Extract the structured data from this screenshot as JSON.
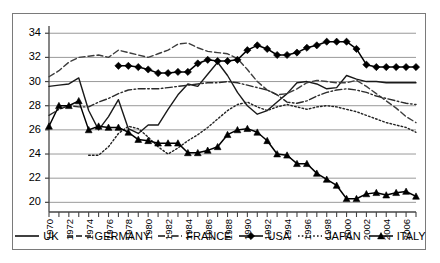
{
  "chart_data": {
    "type": "line",
    "title": "",
    "xlabel": "",
    "ylabel": "",
    "xlim": [
      1970,
      2007
    ],
    "ylim": [
      19.2,
      34.6
    ],
    "yticks": [
      20,
      22,
      24,
      26,
      28,
      30,
      32,
      34
    ],
    "ytick_labels": [
      "20",
      "22",
      "24",
      "26",
      "28",
      "30",
      "32",
      "34"
    ],
    "xticks": [
      1970,
      1971,
      1972,
      1973,
      1974,
      1975,
      1976,
      1977,
      1978,
      1979,
      1980,
      1981,
      1982,
      1983,
      1984,
      1985,
      1986,
      1987,
      1988,
      1989,
      1990,
      1991,
      1992,
      1993,
      1994,
      1995,
      1996,
      1997,
      1998,
      1999,
      2000,
      2001,
      2002,
      2003,
      2004,
      2005,
      2006,
      2007
    ],
    "xtick_labels": [
      "1970",
      "1972",
      "1974",
      "1976",
      "1978",
      "1980",
      "1982",
      "1984",
      "1986",
      "1988",
      "1990",
      "1992",
      "1994",
      "1996",
      "1998",
      "2000",
      "2002",
      "2004",
      "2006"
    ],
    "xtick_labels_years": [
      1970,
      1972,
      1974,
      1976,
      1978,
      1980,
      1982,
      1984,
      1986,
      1988,
      1990,
      1992,
      1994,
      1996,
      1998,
      2000,
      2002,
      2004,
      2006
    ],
    "grid": "horizontal",
    "legend_position": "bottom",
    "x": [
      1970,
      1971,
      1972,
      1973,
      1974,
      1975,
      1976,
      1977,
      1978,
      1979,
      1980,
      1981,
      1982,
      1983,
      1984,
      1985,
      1986,
      1987,
      1988,
      1989,
      1990,
      1991,
      1992,
      1993,
      1994,
      1995,
      1996,
      1997,
      1998,
      1999,
      2000,
      2001,
      2002,
      2003,
      2004,
      2005,
      2006,
      2007
    ],
    "series": [
      {
        "name": "UK",
        "style": "solid",
        "marker": "none",
        "color": "#1a1a1a",
        "x": [
          1970,
          1971,
          1972,
          1973,
          1974,
          1975,
          1976,
          1977,
          1978,
          1979,
          1980,
          1981,
          1982,
          1983,
          1984,
          1985,
          1986,
          1987,
          1988,
          1989,
          1990,
          1991,
          1992,
          1993,
          1994,
          1995,
          1996,
          1997,
          1998,
          1999,
          2000,
          2001,
          2002,
          2003,
          2004,
          2005,
          2006,
          2007
        ],
        "values": [
          29.6,
          29.7,
          29.8,
          30.3,
          27.6,
          26.0,
          27.1,
          28.5,
          26.1,
          25.7,
          26.4,
          26.4,
          27.7,
          28.9,
          29.8,
          29.6,
          30.6,
          31.6,
          30.5,
          29.1,
          28.0,
          27.3,
          27.6,
          28.3,
          29.0,
          29.9,
          30.0,
          29.8,
          29.4,
          29.5,
          30.5,
          30.2,
          30.0,
          30.0,
          29.9,
          29.9,
          29.9,
          29.9
        ]
      },
      {
        "name": "GERMANY",
        "style": "dashed",
        "marker": "none",
        "color": "#3d3d3d",
        "x": [
          1970,
          1971,
          1972,
          1973,
          1974,
          1975,
          1976,
          1977,
          1978,
          1979,
          1980,
          1981,
          1982,
          1983,
          1984,
          1985,
          1986,
          1987,
          1988,
          1989,
          1990,
          1991,
          1992,
          1993,
          1994,
          1995,
          1996,
          1997,
          1998,
          1999,
          2000,
          2001,
          2002,
          2003,
          2004,
          2005,
          2006,
          2007
        ],
        "values": [
          30.4,
          30.9,
          31.6,
          32.0,
          32.1,
          32.2,
          32.0,
          32.6,
          32.4,
          32.2,
          32.0,
          32.3,
          32.6,
          33.1,
          33.2,
          32.8,
          32.5,
          32.4,
          32.3,
          31.9,
          31.0,
          30.0,
          29.3,
          28.9,
          29.0,
          29.4,
          29.9,
          30.1,
          30.0,
          29.9,
          29.9,
          30.1,
          29.6,
          29.0,
          28.4,
          27.8,
          27.1,
          26.6
        ]
      },
      {
        "name": "FRANCE",
        "style": "dashdot",
        "marker": "none",
        "color": "#2b2b2b",
        "x": [
          1970,
          1971,
          1972,
          1973,
          1974,
          1975,
          1976,
          1977,
          1978,
          1979,
          1980,
          1981,
          1982,
          1983,
          1984,
          1985,
          1986,
          1987,
          1988,
          1989,
          1990,
          1991,
          1992,
          1993,
          1994,
          1995,
          1996,
          1997,
          1998,
          1999,
          2000,
          2001,
          2002,
          2003,
          2004,
          2005,
          2006,
          2007
        ],
        "values": [
          27.2,
          27.7,
          28.0,
          27.9,
          27.9,
          28.3,
          28.6,
          29.0,
          29.3,
          29.4,
          29.4,
          29.4,
          29.5,
          29.6,
          29.7,
          29.8,
          29.9,
          29.9,
          30.0,
          29.9,
          29.7,
          29.5,
          29.3,
          28.9,
          28.3,
          28.2,
          28.4,
          28.8,
          29.1,
          29.3,
          29.4,
          29.3,
          29.1,
          28.8,
          28.6,
          28.4,
          28.2,
          28.1
        ]
      },
      {
        "name": "USA",
        "style": "solid",
        "marker": "diamond",
        "color": "#000000",
        "x": [
          1977,
          1978,
          1979,
          1980,
          1981,
          1982,
          1983,
          1984,
          1985,
          1986,
          1987,
          1988,
          1989,
          1990,
          1991,
          1992,
          1993,
          1994,
          1995,
          1996,
          1997,
          1998,
          1999,
          2000,
          2001,
          2002,
          2003,
          2004,
          2005,
          2006,
          2007
        ],
        "values": [
          31.3,
          31.3,
          31.2,
          31.0,
          30.7,
          30.7,
          30.8,
          30.8,
          31.5,
          31.8,
          31.7,
          31.7,
          31.8,
          32.6,
          33.0,
          32.7,
          32.2,
          32.2,
          32.4,
          32.8,
          33.0,
          33.3,
          33.3,
          33.3,
          32.7,
          31.4,
          31.2,
          31.2,
          31.2,
          31.2,
          31.2
        ]
      },
      {
        "name": "JAPAN",
        "style": "dotted",
        "marker": "none",
        "color": "#222222",
        "x": [
          1974,
          1975,
          1976,
          1977,
          1978,
          1979,
          1980,
          1981,
          1982,
          1983,
          1984,
          1985,
          1986,
          1987,
          1988,
          1989,
          1990,
          1991,
          1992,
          1993,
          1994,
          1995,
          1996,
          1997,
          1998,
          1999,
          2000,
          2001,
          2002,
          2003,
          2004,
          2005,
          2006,
          2007
        ],
        "values": [
          23.9,
          23.9,
          24.6,
          25.7,
          26.3,
          26.1,
          25.4,
          24.6,
          24.0,
          24.5,
          25.1,
          25.6,
          26.2,
          26.9,
          27.6,
          28.1,
          28.3,
          27.9,
          27.6,
          27.9,
          28.1,
          27.9,
          27.7,
          27.9,
          28.0,
          27.9,
          27.7,
          27.5,
          27.2,
          26.9,
          26.6,
          26.4,
          26.2,
          25.8
        ]
      },
      {
        "name": "ITALY",
        "style": "solid",
        "marker": "triangle",
        "color": "#000000",
        "x": [
          1970,
          1971,
          1972,
          1973,
          1974,
          1975,
          1976,
          1977,
          1978,
          1979,
          1980,
          1981,
          1982,
          1983,
          1984,
          1985,
          1986,
          1987,
          1988,
          1989,
          1990,
          1991,
          1992,
          1993,
          1994,
          1995,
          1996,
          1997,
          1998,
          1999,
          2000,
          2001,
          2002,
          2003,
          2004,
          2005,
          2006,
          2007
        ],
        "values": [
          26.3,
          28.0,
          28.0,
          28.4,
          26.0,
          26.3,
          26.2,
          26.2,
          25.8,
          25.2,
          25.1,
          24.9,
          24.9,
          24.9,
          24.1,
          24.1,
          24.3,
          24.6,
          25.6,
          26.0,
          26.1,
          25.8,
          25.1,
          24.0,
          23.9,
          23.2,
          23.2,
          22.4,
          21.9,
          21.4,
          20.3,
          20.3,
          20.7,
          20.8,
          20.6,
          20.8,
          20.9,
          20.5
        ]
      }
    ]
  },
  "legend": {
    "items": [
      {
        "label": "UK",
        "style": "solid",
        "marker": "none"
      },
      {
        "label": "GERMANY",
        "style": "dashed",
        "marker": "none"
      },
      {
        "label": "FRANCE",
        "style": "dashdot",
        "marker": "none"
      },
      {
        "label": "USA",
        "style": "solid",
        "marker": "diamond"
      },
      {
        "label": "JAPAN",
        "style": "dotted",
        "marker": "none"
      },
      {
        "label": "ITALY",
        "style": "solid",
        "marker": "triangle"
      }
    ]
  },
  "colors": {
    "frame": "#7a7a7a",
    "grid": "#9a9a9a",
    "axis": "#444444",
    "text": "#000000",
    "background": "#ffffff"
  }
}
